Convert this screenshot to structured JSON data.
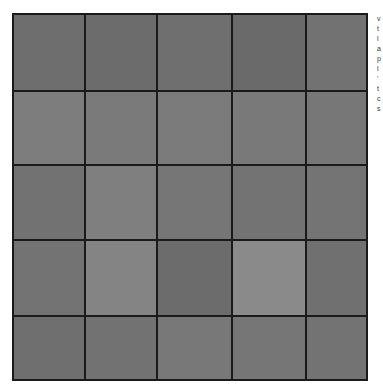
{
  "grid": {
    "rows": 5,
    "columns": 5,
    "cell_colors": [
      [
        "#6e6e6e",
        "#6c6c6c",
        "#6f6f6f",
        "#6a6a6a",
        "#727272"
      ],
      [
        "#7d7d7d",
        "#7a7a7a",
        "#7b7b7b",
        "#797979",
        "#777777"
      ],
      [
        "#727272",
        "#7f7f7f",
        "#767676",
        "#737373",
        "#747474"
      ],
      [
        "#737373",
        "#848484",
        "#6c6c6c",
        "#8a8a8a",
        "#707070"
      ],
      [
        "#6f6f6f",
        "#727272",
        "#787878",
        "#767676",
        "#737373"
      ]
    ],
    "line_color": "#1a1a1a"
  },
  "side_text_fragments": [
    "v",
    "t",
    "l",
    "a",
    "p",
    "l",
    "'",
    "t",
    "c",
    "s"
  ]
}
